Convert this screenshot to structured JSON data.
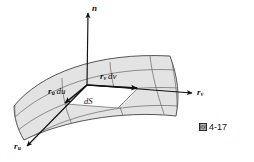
{
  "figure": {
    "caption_marker": "図",
    "caption_number": "4-17",
    "labels": {
      "normal_vector": "n",
      "tangent_v_axis_base": "r",
      "tangent_v_axis_sub": "v",
      "tangent_u_axis_base": "r",
      "tangent_u_axis_sub": "u",
      "dv_vector_base": "r",
      "dv_vector_sub": "v",
      "dv_vector_diff": "dv",
      "du_vector_base": "r",
      "du_vector_sub": "u",
      "du_vector_diff": "du",
      "area_element": "dS"
    },
    "colors": {
      "surface_fill": "#e3e3e3",
      "patch_fill": "#ffffff",
      "grid_line": "#6f6f6f",
      "outline": "#3a3a3a",
      "vector_line": "#111111",
      "background": "#ffffff",
      "text": "#111111",
      "caption_marker_bg": "#2b2b2b"
    },
    "geometry": {
      "origin_point": [
        87,
        85
      ],
      "normal_tip": [
        88,
        12
      ],
      "tangent_v_tip": [
        193,
        93
      ],
      "tangent_u_tip": [
        26,
        147
      ],
      "dv_tip": [
        138,
        88
      ],
      "du_tip": [
        64,
        104
      ]
    }
  }
}
